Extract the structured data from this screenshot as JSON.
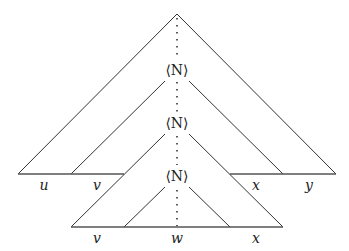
{
  "diagram": {
    "type": "pumping-lemma-derivation-tree",
    "nodes": [
      {
        "id": "root",
        "label": ""
      },
      {
        "id": "n1",
        "label": "⟨N⟩"
      },
      {
        "id": "n2",
        "label": "⟨N⟩"
      },
      {
        "id": "n3",
        "label": "⟨N⟩"
      }
    ],
    "upper_yield": {
      "segments": [
        "u",
        "v",
        "x",
        "y"
      ]
    },
    "lower_yield": {
      "segments": [
        "v",
        "w",
        "x"
      ]
    }
  }
}
